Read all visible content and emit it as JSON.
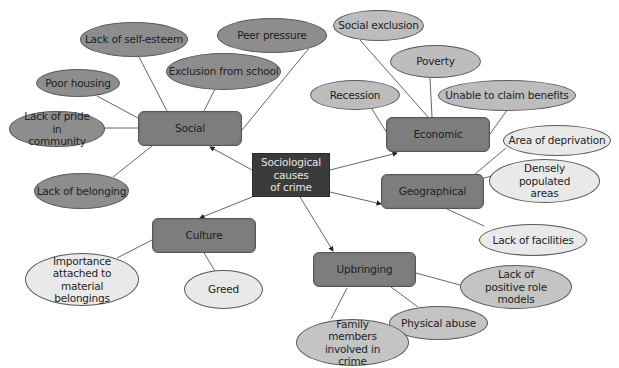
{
  "diagram": {
    "center": {
      "label": "Sociological causes of crime",
      "line1": "Sociological causes",
      "line2": "of crime"
    },
    "categories": [
      {
        "id": "social",
        "label": "Social",
        "causes": [
          "Lack of self-esteem",
          "Peer pressure",
          "Poor housing",
          "Exclusion from school",
          "Lack of pride in community",
          "Lack of belonging"
        ]
      },
      {
        "id": "economic",
        "label": "Economic",
        "causes": [
          "Social exclusion",
          "Poverty",
          "Recession",
          "Unable to claim benefits"
        ]
      },
      {
        "id": "geographical",
        "label": "Geographical",
        "causes": [
          "Area of deprivation",
          "Densely populated areas",
          "Lack of facilities"
        ]
      },
      {
        "id": "culture",
        "label": "Culture",
        "causes": [
          "Importance attached to material belongings",
          "Greed"
        ]
      },
      {
        "id": "upbringing",
        "label": "Upbringing",
        "causes": [
          "Lack of positive role models",
          "Physical abuse",
          "Family members involved in crime"
        ]
      }
    ]
  },
  "colors": {
    "center_fill": "#3b3b3b",
    "category_fill": "#7d7d7d",
    "social_causes_fill": "#8d8d8d",
    "economic_causes_fill": "#bdbdbd",
    "geographical_causes_fill": "#e9e9e9",
    "culture_causes_fill": "#e9e9e9",
    "upbringing_causes_fill": "#c4c4c4",
    "line": "#555555"
  }
}
